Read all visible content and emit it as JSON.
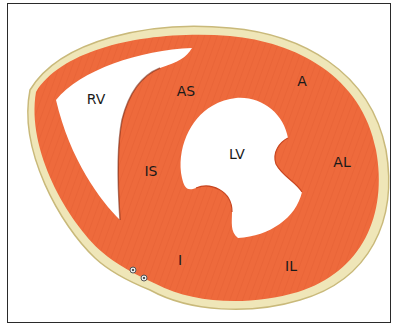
{
  "figure": {
    "type": "short-axis cross-section of heart ventricles",
    "colors": {
      "myocardium": "#ee6a3c",
      "myocardium_dark": "#d9542a",
      "pericardium": "#efe6b8",
      "pericardium_edge": "#c9b97a",
      "cavity": "#ffffff",
      "frame": "#2a2a2a"
    },
    "labels": {
      "rv": "RV",
      "lv": "LV",
      "as": "AS",
      "a": "A",
      "al": "AL",
      "is": "IS",
      "i": "I",
      "il": "IL"
    }
  }
}
